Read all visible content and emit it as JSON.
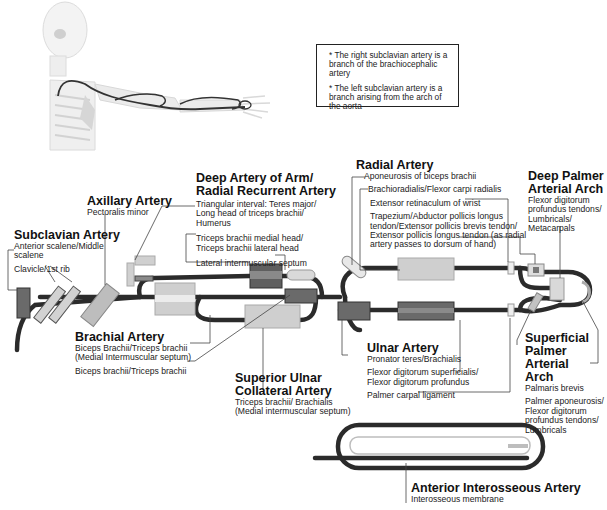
{
  "note_box": {
    "lines": [
      "* The right subclavian artery is a branch of the brachiocephalic artery",
      "* The left subclavian artery is a branch arising from the arch of the aorta"
    ]
  },
  "arteries": {
    "subclavian": {
      "title": "Subclavian Artery",
      "sub1": "Anterior scalene/Middle",
      "sub2": "scalene",
      "sub3": "Clavicle/1st rib"
    },
    "axillary": {
      "title": "Axillary Artery",
      "sub1": "Pectoralis minor"
    },
    "deep_arm": {
      "title1": "Deep Artery of Arm/",
      "title2": "Radial Recurrent Artery",
      "sub1": "Triangular interval: Teres major/",
      "sub2": "Long head of triceps brachii/",
      "sub3": "Humerus",
      "sub4": "Triceps brachii medial head/",
      "sub5": "Triceps brachii lateral head",
      "sub6": "Lateral intermuscular septum"
    },
    "radial": {
      "title": "Radial Artery",
      "sub1": "Aponeurosis of biceps brachii",
      "sub2": "Brachioradialis/Flexor carpi radialis",
      "sub3": "Extensor retinaculum of wrist",
      "sub4": "Trapezium/Abductor pollicis longus",
      "sub5": "tendon/Extensor pollicis brevis tendon/",
      "sub6": "Extensor pollicis longus tendon (as radial",
      "sub7": "artery passes to dorsum of hand)"
    },
    "deep_palmar": {
      "title1": "Deep Palmer",
      "title2": "Arterial Arch",
      "sub1": "Flexor digitorum",
      "sub2": "profundus tendons/",
      "sub3": "Lumbricals/",
      "sub4": "Metacarpals"
    },
    "brachial": {
      "title": "Brachial Artery",
      "sub1": "Biceps Brachii/Triceps brachii",
      "sub2": "(Medial Intermuscular septum)",
      "sub3": "Biceps brachii/Triceps brachii"
    },
    "superior_ulnar": {
      "title1": "Superior Ulnar",
      "title2": "Collateral Artery",
      "sub1": "Triceps brachii/ Brachialis",
      "sub2": "(Medial intermuscular septum)"
    },
    "ulnar": {
      "title": "Ulnar Artery",
      "sub1": "Pronator teres/Brachialis",
      "sub2": "Flexor digitorum superficialis/",
      "sub3": "Flexor digitorum profundus",
      "sub4": "Palmer carpal ligament"
    },
    "superficial_palmar": {
      "title1": "Superficial",
      "title2": "Palmer Arterial",
      "title3": "Arch",
      "sub1": "Palmaris brevis",
      "sub2": "Palmer aponeurosis/",
      "sub3": "Flexor digitorum",
      "sub4": "profundus tendons/",
      "sub5": "Lumbricals"
    },
    "anterior_interosseous": {
      "title": "Anterior Interosseous Artery",
      "sub1": "Interosseous membrane"
    }
  },
  "colors": {
    "artery": "#2b2b2b",
    "muscle_dark": "#6f6f6f",
    "muscle_light": "#c8c8c8",
    "bone": "#d9d9d9",
    "leader": "#444444"
  }
}
